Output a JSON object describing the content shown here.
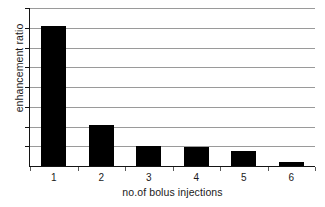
{
  "chart_data": {
    "type": "bar",
    "title": "",
    "xlabel": "no.of bolus injections",
    "ylabel": "enhancement ratio",
    "categories": [
      "1",
      "2",
      "3",
      "4",
      "5",
      "6"
    ],
    "values": [
      7.1,
      2.1,
      1.0,
      0.96,
      0.76,
      0.2
    ],
    "ylim": [
      0,
      8
    ],
    "yticklabels": [],
    "gridlines": 8,
    "grid": true,
    "legend": false,
    "bar_color": "#000000",
    "grid_color": "#9a9a9a",
    "axis_color": "#141414",
    "background": "#ffffff"
  }
}
